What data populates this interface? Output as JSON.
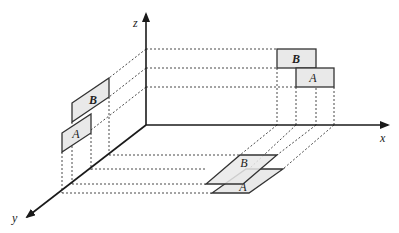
{
  "diagram": {
    "axes": {
      "x_label": "x",
      "y_label": "y",
      "z_label": "z"
    },
    "objects": [
      {
        "name": "A",
        "label": "A"
      },
      {
        "name": "B",
        "label": "B"
      }
    ],
    "projections": {
      "xz_plane": {
        "A_label": "A",
        "B_label": "B"
      },
      "yz_plane": {
        "A_label": "A",
        "B_label": "B"
      },
      "xy_plane": {
        "A_label": "A",
        "B_label": "B"
      }
    },
    "colors": {
      "panel_fill": "#e9e9e9",
      "line": "#333333"
    }
  }
}
